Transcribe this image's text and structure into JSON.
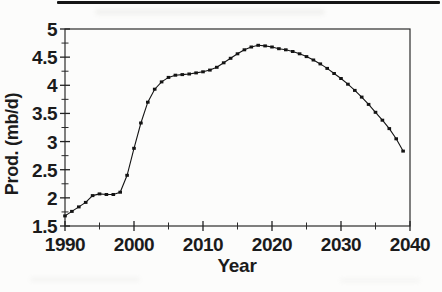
{
  "figure": {
    "kind": "scanned line chart figure",
    "ink_color": "#1b1b1b",
    "background_color": "#fcfcfb",
    "top_rule_color": "#161616"
  },
  "chart_data": {
    "type": "line",
    "title": "",
    "xlabel": "Year",
    "ylabel": "Prod. (mb/d)",
    "xlim": [
      1990,
      2040
    ],
    "ylim": [
      1.5,
      5
    ],
    "grid": false,
    "legend": "none",
    "marker": "filled-square",
    "line_color": "#141414",
    "xticks_major": [
      1990,
      2000,
      2010,
      2020,
      2030,
      2040
    ],
    "xticks_minor": [
      1995,
      2005,
      2015,
      2025,
      2035
    ],
    "yticks_major": [
      5,
      4.5,
      4,
      3.5,
      3,
      2.5,
      2,
      1.5
    ],
    "yticks_minor": [
      4.75,
      4.25,
      3.75,
      3.25,
      2.75,
      2.25,
      1.75
    ],
    "xtick_labels": [
      "1990",
      "2000",
      "2010",
      "2020",
      "2030",
      "2040"
    ],
    "ytick_labels": [
      "5",
      "4.5",
      "4",
      "3.5",
      "3",
      "2.5",
      "2",
      "1.5"
    ],
    "series": [
      {
        "name": "Oil production forecast",
        "x": [
          1990,
          1991,
          1992,
          1993,
          1994,
          1995,
          1996,
          1997,
          1998,
          1999,
          2000,
          2001,
          2002,
          2003,
          2004,
          2005,
          2006,
          2007,
          2008,
          2009,
          2010,
          2011,
          2012,
          2013,
          2014,
          2015,
          2016,
          2017,
          2018,
          2019,
          2020,
          2021,
          2022,
          2023,
          2024,
          2025,
          2026,
          2027,
          2028,
          2029,
          2030,
          2031,
          2032,
          2033,
          2034,
          2035,
          2036,
          2037,
          2038,
          2039
        ],
        "y": [
          1.68,
          1.76,
          1.84,
          1.92,
          2.04,
          2.07,
          2.06,
          2.06,
          2.1,
          2.4,
          2.88,
          3.33,
          3.7,
          3.93,
          4.06,
          4.14,
          4.18,
          4.19,
          4.2,
          4.22,
          4.24,
          4.27,
          4.32,
          4.4,
          4.48,
          4.56,
          4.63,
          4.68,
          4.71,
          4.7,
          4.68,
          4.65,
          4.63,
          4.6,
          4.56,
          4.51,
          4.45,
          4.38,
          4.3,
          4.21,
          4.12,
          4.02,
          3.91,
          3.79,
          3.66,
          3.52,
          3.38,
          3.23,
          3.05,
          2.83
        ]
      }
    ]
  }
}
